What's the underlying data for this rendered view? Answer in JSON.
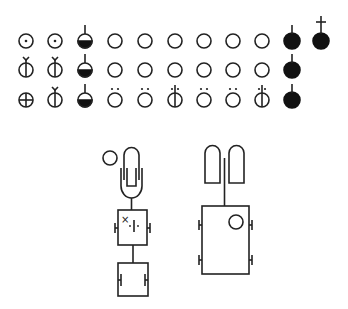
{
  "diagram": {
    "title": "",
    "stroke_color": "#222222",
    "fill_color": "#111111",
    "background": "#ffffff",
    "symbol_grid": {
      "columns_x": [
        26,
        55,
        85,
        115,
        145,
        175,
        204,
        233,
        262,
        292,
        321
      ],
      "rows_y": [
        41,
        70,
        100
      ],
      "radius": 7,
      "rows": [
        [
          "dot-circle",
          "dot-circle",
          "half-filled-stem",
          "circle",
          "circle",
          "circle",
          "circle",
          "circle",
          "circle",
          "filled-stem",
          "filled-cross-stem"
        ],
        [
          "fork-bar-circle",
          "fork-bar-circle",
          "half-filled-stem",
          "circle",
          "circle",
          "circle",
          "circle",
          "circle",
          "circle",
          "filled-stem",
          null
        ],
        [
          "cross-circle",
          "fork-bar-circle",
          "half-filled-stem",
          "umlaut-circle",
          "umlaut-circle",
          "umlaut-bar-circle",
          "umlaut-circle",
          "umlaut-circle",
          "umlaut-bar-circle",
          "filled-stem",
          null
        ]
      ]
    },
    "left_figure": {
      "small_circle": {
        "cx": 110,
        "cy": 158,
        "r": 7
      },
      "capsule_outer": {
        "x": 122,
        "y": 145,
        "w": 19,
        "h": 53
      },
      "capsule_inner": {
        "x": 127,
        "y": 154,
        "w": 8,
        "h": 31
      },
      "upper_box": {
        "x": 118,
        "y": 210,
        "w": 29,
        "h": 35,
        "marks": [
          "×",
          "·|·"
        ]
      },
      "lower_box": {
        "x": 118,
        "y": 263,
        "w": 30,
        "h": 33
      }
    },
    "right_figure": {
      "tab_left": {
        "x": 205,
        "y": 146,
        "w": 15,
        "h": 37
      },
      "tab_right": {
        "x": 229,
        "y": 146,
        "w": 15,
        "h": 37
      },
      "stem_x": 224,
      "box": {
        "x": 202,
        "y": 206,
        "w": 47,
        "h": 68
      },
      "circle": {
        "cx": 236,
        "cy": 222,
        "r": 7
      }
    }
  }
}
